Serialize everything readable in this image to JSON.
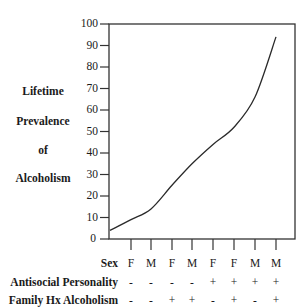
{
  "chart_data": {
    "type": "line",
    "title": "",
    "xlabel": "",
    "ylabel": "Lifetime Prevalence of Alcoholism",
    "ylabel_words": [
      "Lifetime",
      "Prevalence",
      "of",
      "Alcoholism"
    ],
    "ylim": [
      0,
      100
    ],
    "yticks": [
      0,
      10,
      20,
      30,
      40,
      50,
      60,
      70,
      80,
      90,
      100
    ],
    "grid": false,
    "legend": null,
    "start_value": 4,
    "categories": [
      {
        "sex": "F",
        "antisocial_personality": "-",
        "family_hx_alcoholism": "-"
      },
      {
        "sex": "M",
        "antisocial_personality": "-",
        "family_hx_alcoholism": "-"
      },
      {
        "sex": "F",
        "antisocial_personality": "-",
        "family_hx_alcoholism": "+"
      },
      {
        "sex": "M",
        "antisocial_personality": "-",
        "family_hx_alcoholism": "+"
      },
      {
        "sex": "F",
        "antisocial_personality": "+",
        "family_hx_alcoholism": "-"
      },
      {
        "sex": "F",
        "antisocial_personality": "+",
        "family_hx_alcoholism": "+"
      },
      {
        "sex": "M",
        "antisocial_personality": "+",
        "family_hx_alcoholism": "-"
      },
      {
        "sex": "M",
        "antisocial_personality": "+",
        "family_hx_alcoholism": "+"
      }
    ],
    "series": [
      {
        "name": "Lifetime Prevalence of Alcoholism",
        "values": [
          9,
          14,
          25,
          35,
          44,
          52,
          66,
          94
        ]
      }
    ]
  },
  "axis": {
    "ytick_labels": [
      "0",
      "10",
      "20",
      "30",
      "40",
      "50",
      "60",
      "70",
      "80",
      "90",
      "100"
    ]
  },
  "labels": {
    "ylabel_words": [
      "Lifetime",
      "Prevalence",
      "of",
      "Alcoholism"
    ],
    "row_sex": "Sex",
    "row_antisocial": "Antisocial Personality",
    "row_family": "Family Hx Alcoholism"
  },
  "rows": {
    "sex": [
      "F",
      "M",
      "F",
      "M",
      "F",
      "F",
      "M",
      "M"
    ],
    "antisocial": [
      "-",
      "-",
      "-",
      "-",
      "+",
      "+",
      "+",
      "+"
    ],
    "family": [
      "-",
      "-",
      "+",
      "+",
      "-",
      "+",
      "-",
      "+"
    ]
  },
  "colors": {
    "line": "#2a2a2a",
    "axis": "#333333",
    "background": "#ffffff"
  }
}
